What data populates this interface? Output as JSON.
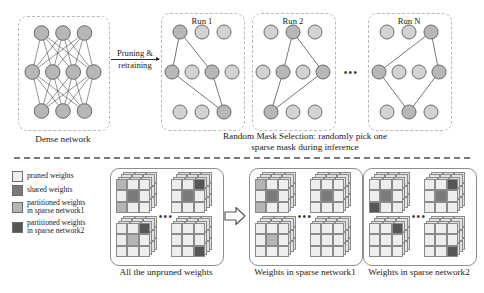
{
  "figure": {
    "divider": "dashed-horizontal-separator"
  },
  "top_section": {
    "dense_network": {
      "caption": "Dense network",
      "layers": [
        3,
        4,
        3
      ],
      "fully_connected": true,
      "node_fill": "#b7b7b7",
      "node_stroke": "#5e5e5e"
    },
    "transform_arrow": {
      "line1": "Pruning &",
      "line2": "retraining",
      "icon": "right-arrow-icon"
    },
    "runs": [
      {
        "label": "Run 1",
        "active_nodes": {
          "top": [
            1
          ],
          "mid": [
            1,
            3
          ],
          "bottom": [
            3
          ]
        },
        "edges": [
          [
            "top1",
            "mid1"
          ],
          [
            "top1",
            "mid3"
          ],
          [
            "mid1",
            "bottom3"
          ],
          [
            "mid3",
            "bottom3"
          ]
        ]
      },
      {
        "label": "Run 2",
        "active_nodes": {
          "top": [
            2
          ],
          "mid": [
            2,
            4
          ],
          "bottom": [
            1
          ]
        },
        "edges": [
          [
            "top2",
            "mid2"
          ],
          [
            "top2",
            "mid4"
          ],
          [
            "mid2",
            "bottom1"
          ],
          [
            "mid4",
            "bottom1"
          ]
        ]
      },
      {
        "label": "Run N",
        "active_nodes": {
          "top": [
            3
          ],
          "mid": [
            1,
            4
          ],
          "bottom": [
            2
          ]
        },
        "edges": [
          [
            "top3",
            "mid1"
          ],
          [
            "top3",
            "mid4"
          ],
          [
            "mid1",
            "bottom2"
          ],
          [
            "mid4",
            "bottom2"
          ]
        ]
      }
    ],
    "runs_ellipsis": "•••",
    "runs_caption_line1": "Random Mask Selection: randomly pick one",
    "runs_caption_line2": "sparse mask during inference"
  },
  "bottom_section": {
    "legend": [
      {
        "label": "pruned weights",
        "color": "#eeeeee"
      },
      {
        "label": "shared weights",
        "color": "#7a7a7a"
      },
      {
        "label": "partitioned weights\nin sparse network1",
        "color": "#b5b5b5"
      },
      {
        "label": "partitioned weights\nin sparse network2",
        "color": "#565656"
      }
    ],
    "colors": {
      "pruned": "#eeeeee",
      "shared": "#7a7a7a",
      "partition1": "#b5b5b5",
      "partition2": "#565656",
      "grid_stroke": "#8a8a8a",
      "stack_back": "#e2e2e2"
    },
    "panels": [
      {
        "caption": "All the unpruned weights",
        "ellipsis": "•••",
        "matrices": [
          {
            "cells": [
              "partition1",
              "pruned",
              "pruned",
              "pruned",
              "shared",
              "pruned",
              "partition1",
              "pruned",
              "pruned"
            ]
          },
          {
            "cells": [
              "pruned",
              "pruned",
              "partition2",
              "pruned",
              "shared",
              "pruned",
              "pruned",
              "pruned",
              "pruned"
            ]
          },
          {
            "cells": [
              "pruned",
              "pruned",
              "partition2",
              "pruned",
              "partition1",
              "pruned",
              "pruned",
              "pruned",
              "pruned"
            ]
          },
          {
            "cells": [
              "pruned",
              "pruned",
              "pruned",
              "pruned",
              "pruned",
              "pruned",
              "pruned",
              "pruned",
              "partition2"
            ]
          }
        ]
      },
      {
        "caption": "Weights in sparse network1",
        "ellipsis": "•••",
        "matrices": [
          {
            "cells": [
              "partition1",
              "pruned",
              "pruned",
              "pruned",
              "shared",
              "pruned",
              "partition1",
              "pruned",
              "pruned"
            ]
          },
          {
            "cells": [
              "pruned",
              "pruned",
              "pruned",
              "pruned",
              "shared",
              "pruned",
              "pruned",
              "pruned",
              "pruned"
            ]
          },
          {
            "cells": [
              "pruned",
              "pruned",
              "pruned",
              "pruned",
              "partition1",
              "pruned",
              "pruned",
              "pruned",
              "pruned"
            ]
          },
          {
            "cells": [
              "pruned",
              "pruned",
              "pruned",
              "pruned",
              "pruned",
              "pruned",
              "pruned",
              "pruned",
              "pruned"
            ]
          }
        ]
      },
      {
        "caption": "Weights in sparse network2",
        "ellipsis": "•••",
        "matrices": [
          {
            "cells": [
              "pruned",
              "pruned",
              "pruned",
              "pruned",
              "shared",
              "pruned",
              "partition2",
              "pruned",
              "pruned"
            ]
          },
          {
            "cells": [
              "pruned",
              "pruned",
              "partition2",
              "pruned",
              "shared",
              "pruned",
              "pruned",
              "pruned",
              "pruned"
            ]
          },
          {
            "cells": [
              "pruned",
              "pruned",
              "partition2",
              "pruned",
              "pruned",
              "pruned",
              "pruned",
              "pruned",
              "pruned"
            ]
          },
          {
            "cells": [
              "pruned",
              "pruned",
              "pruned",
              "pruned",
              "pruned",
              "pruned",
              "pruned",
              "pruned",
              "partition2"
            ]
          }
        ]
      }
    ],
    "flow_arrow": "right-block-arrow-icon"
  }
}
